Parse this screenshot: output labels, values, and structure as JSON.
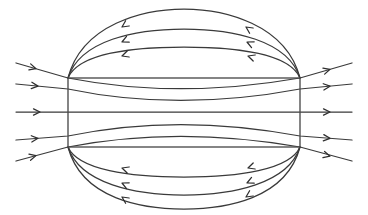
{
  "figure": {
    "type": "field-line-diagram",
    "background_color": "#ffffff",
    "line_color": "#3a3a3a",
    "arrow_color": "#2e2e2e",
    "core_edge_color": "#4a4a4a",
    "canvas": {
      "width": 368,
      "height": 215
    }
  },
  "core": {
    "label": "rectangular-region",
    "x": 68,
    "y": 78,
    "width": 232,
    "height": 69,
    "left": 68,
    "right": 300,
    "top": 78,
    "bottom": 147
  },
  "chart_data": {
    "type": "line",
    "xlabel": "",
    "ylabel": "",
    "xlim": [
      0,
      368
    ],
    "ylim": [
      0,
      215
    ],
    "grid": false,
    "legend": null,
    "flow_direction": "left-to-right inside region, right-to-left on return arcs",
    "region_rect": {
      "left": 68,
      "top": 78,
      "right": 300,
      "bottom": 147
    },
    "series": [
      {
        "name": "flux-line-1",
        "role": "through-line-upper-outer",
        "path": "M 16 63 L 68 78 C 140 92 220 92 300 78 L 352 63",
        "entry_y": 78,
        "exit_y": 78,
        "arrows": [
          {
            "x": 36,
            "y": 68.7,
            "angle": 16
          },
          {
            "x": 330,
            "y": 69.3,
            "angle": -16
          }
        ]
      },
      {
        "name": "flux-line-2",
        "role": "through-line-upper-inner",
        "path": "M 16 84 L 68 89 C 140 104 220 104 300 89 L 352 84",
        "entry_y": 89,
        "exit_y": 89,
        "arrows": [
          {
            "x": 38,
            "y": 86.1,
            "angle": 6
          },
          {
            "x": 330,
            "y": 86.2,
            "angle": -6
          }
        ]
      },
      {
        "name": "flux-line-3",
        "role": "through-line-center",
        "path": "M 16 112 L 352 112",
        "entry_y": 112,
        "exit_y": 112,
        "arrows": [
          {
            "x": 40,
            "y": 112,
            "angle": 0
          },
          {
            "x": 330,
            "y": 112,
            "angle": 0
          }
        ]
      },
      {
        "name": "flux-line-4",
        "role": "through-line-lower-inner",
        "path": "M 16 140 L 68 136 C 140 121 220 121 300 136 L 352 140",
        "entry_y": 136,
        "exit_y": 136,
        "arrows": [
          {
            "x": 38,
            "y": 138.3,
            "angle": -5
          },
          {
            "x": 330,
            "y": 138.3,
            "angle": 5
          }
        ]
      },
      {
        "name": "flux-line-5",
        "role": "through-line-lower-outer",
        "path": "M 16 161 L 68 147 C 140 133 220 133 300 147 L 352 161",
        "entry_y": 147,
        "exit_y": 147,
        "arrows": [
          {
            "x": 36,
            "y": 155.6,
            "angle": -15
          },
          {
            "x": 330,
            "y": 156.2,
            "angle": 15
          }
        ]
      }
    ],
    "return_arcs_top": [
      {
        "name": "return-arc-top-outer",
        "path": "M 300 78 C 286 24 224 9 184 9 C 144 9 82 24 68 78",
        "apex_y": 11,
        "arrows": [
          {
            "x": 246,
            "y": 27,
            "angle": 214
          },
          {
            "x": 122,
            "y": 27,
            "angle": 146
          }
        ]
      },
      {
        "name": "return-arc-top-middle",
        "path": "M 300 78 C 288 40 232 29 184 29 C 136 29 80 40 68 78",
        "apex_y": 31,
        "arrows": [
          {
            "x": 247,
            "y": 42,
            "angle": 205
          },
          {
            "x": 122,
            "y": 42,
            "angle": 155
          }
        ]
      },
      {
        "name": "return-arc-top-inner",
        "path": "M 300 78 C 290 54 238 47 184 47 C 130 47 78 54 68 78",
        "apex_y": 48,
        "arrows": [
          {
            "x": 248,
            "y": 56,
            "angle": 198
          },
          {
            "x": 122,
            "y": 56,
            "angle": 162
          }
        ]
      }
    ],
    "return_arcs_bottom": [
      {
        "name": "return-arc-bottom-inner",
        "path": "M 300 147 C 290 170 238 177 184 177 C 130 177 78 170 68 147",
        "apex_y": 176,
        "arrows": [
          {
            "x": 248,
            "y": 168,
            "angle": 162
          },
          {
            "x": 122,
            "y": 168,
            "angle": 198
          }
        ]
      },
      {
        "name": "return-arc-bottom-middle",
        "path": "M 300 147 C 288 184 232 195 184 195 C 136 195 80 184 68 147",
        "apex_y": 194,
        "arrows": [
          {
            "x": 247,
            "y": 183,
            "angle": 155
          },
          {
            "x": 122,
            "y": 183,
            "angle": 205
          }
        ]
      },
      {
        "name": "return-arc-bottom-outer",
        "path": "M 300 147 C 286 200 224 209 184 209 C 144 209 82 200 68 147",
        "apex_y": 208,
        "arrows": [
          {
            "x": 246,
            "y": 197,
            "angle": 146
          },
          {
            "x": 122,
            "y": 197,
            "angle": 214
          }
        ]
      }
    ]
  }
}
